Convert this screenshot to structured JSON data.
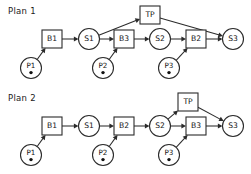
{
  "figure": {
    "type": "diagram",
    "title_absent": true,
    "background": "#ffffff",
    "stroke_color": "#2b2b2b",
    "text_color": "#121212"
  },
  "plans": [
    {
      "id": "plan-1",
      "label": "Plan 1",
      "label_pos": {
        "x": 8,
        "y": 14
      },
      "nodes": [
        {
          "id": "p1",
          "text": "P1",
          "shape": "circle-dot",
          "cx": 31,
          "cy": 68,
          "r": 10.5
        },
        {
          "id": "b1",
          "text": "B1",
          "shape": "box",
          "cx": 52,
          "cy": 39,
          "w": 20,
          "h": 18
        },
        {
          "id": "s1",
          "text": "S1",
          "shape": "circle",
          "cx": 89,
          "cy": 39,
          "r": 10.5
        },
        {
          "id": "tp",
          "text": "TP",
          "shape": "box",
          "cx": 150,
          "cy": 15,
          "w": 20,
          "h": 18
        },
        {
          "id": "b3",
          "text": "B3",
          "shape": "box",
          "cx": 124,
          "cy": 39,
          "w": 20,
          "h": 18
        },
        {
          "id": "p2",
          "text": "P2",
          "shape": "circle-dot",
          "cx": 103,
          "cy": 68,
          "r": 10.5
        },
        {
          "id": "s2",
          "text": "S2",
          "shape": "circle",
          "cx": 160,
          "cy": 39,
          "r": 10.5
        },
        {
          "id": "b2",
          "text": "B2",
          "shape": "box",
          "cx": 196,
          "cy": 39,
          "w": 20,
          "h": 18
        },
        {
          "id": "p3",
          "text": "P3",
          "shape": "circle-dot",
          "cx": 169,
          "cy": 68,
          "r": 10.5
        },
        {
          "id": "s3",
          "text": "S3",
          "shape": "circle",
          "cx": 233,
          "cy": 39,
          "r": 10.5
        }
      ],
      "edges": [
        {
          "from": "p1",
          "to": "b1"
        },
        {
          "from": "b1",
          "to": "s1"
        },
        {
          "from": "s1",
          "to": "b3"
        },
        {
          "from": "s1",
          "to": "tp"
        },
        {
          "from": "b3",
          "to": "s2"
        },
        {
          "from": "p2",
          "to": "b3"
        },
        {
          "from": "s2",
          "to": "b2"
        },
        {
          "from": "p3",
          "to": "b2"
        },
        {
          "from": "b2",
          "to": "s3"
        },
        {
          "from": "tp",
          "to": "s3"
        }
      ]
    },
    {
      "id": "plan-2",
      "label": "Plan 2",
      "label_pos": {
        "x": 8,
        "y": 101
      },
      "nodes": [
        {
          "id": "p1",
          "text": "P1",
          "shape": "circle-dot",
          "cx": 31,
          "cy": 155,
          "r": 10.5
        },
        {
          "id": "b1",
          "text": "B1",
          "shape": "box",
          "cx": 52,
          "cy": 126,
          "w": 20,
          "h": 18
        },
        {
          "id": "s1",
          "text": "S1",
          "shape": "circle",
          "cx": 89,
          "cy": 126,
          "r": 10.5
        },
        {
          "id": "b2",
          "text": "B2",
          "shape": "box",
          "cx": 124,
          "cy": 126,
          "w": 20,
          "h": 18
        },
        {
          "id": "p2",
          "text": "P2",
          "shape": "circle-dot",
          "cx": 103,
          "cy": 155,
          "r": 10.5
        },
        {
          "id": "s2",
          "text": "S2",
          "shape": "circle",
          "cx": 160,
          "cy": 126,
          "r": 10.5
        },
        {
          "id": "tp",
          "text": "TP",
          "shape": "box",
          "cx": 188,
          "cy": 102,
          "w": 20,
          "h": 18
        },
        {
          "id": "b3",
          "text": "B3",
          "shape": "box",
          "cx": 196,
          "cy": 126,
          "w": 20,
          "h": 18
        },
        {
          "id": "p3",
          "text": "P3",
          "shape": "circle-dot",
          "cx": 169,
          "cy": 155,
          "r": 10.5
        },
        {
          "id": "s3",
          "text": "S3",
          "shape": "circle",
          "cx": 233,
          "cy": 126,
          "r": 10.5
        }
      ],
      "edges": [
        {
          "from": "p1",
          "to": "b1"
        },
        {
          "from": "b1",
          "to": "s1"
        },
        {
          "from": "s1",
          "to": "b2"
        },
        {
          "from": "p2",
          "to": "b2"
        },
        {
          "from": "b2",
          "to": "s2"
        },
        {
          "from": "s2",
          "to": "tp"
        },
        {
          "from": "s2",
          "to": "b3"
        },
        {
          "from": "p3",
          "to": "b3"
        },
        {
          "from": "b3",
          "to": "s3"
        },
        {
          "from": "tp",
          "to": "s3"
        }
      ]
    }
  ]
}
